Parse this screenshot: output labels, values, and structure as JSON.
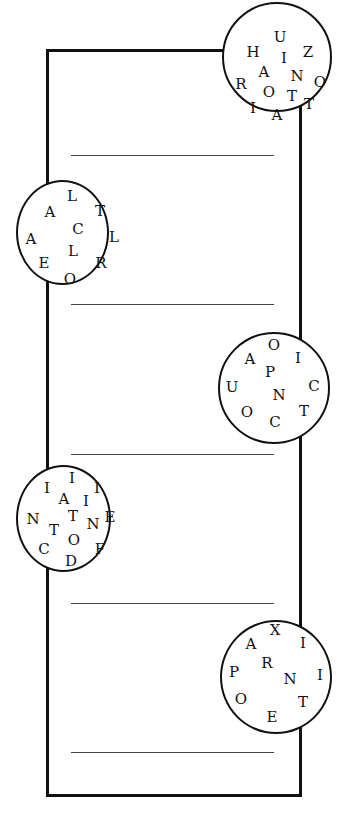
{
  "puzzle": {
    "circles": [
      {
        "letters": [
          "U",
          "H",
          "I",
          "Z",
          "A",
          "N",
          "O",
          "R",
          "O",
          "T",
          "I",
          "A",
          "T"
        ]
      },
      {
        "letters": [
          "L",
          "A",
          "T",
          "C",
          "A",
          "L",
          "L",
          "E",
          "R",
          "O"
        ]
      },
      {
        "letters": [
          "O",
          "A",
          "I",
          "P",
          "U",
          "C",
          "N",
          "O",
          "T",
          "C"
        ]
      },
      {
        "letters": [
          "I",
          "I",
          "A",
          "I",
          "I",
          "N",
          "T",
          "N",
          "E",
          "T",
          "O",
          "C",
          "F",
          "D"
        ]
      },
      {
        "letters": [
          "X",
          "A",
          "I",
          "R",
          "P",
          "N",
          "I",
          "O",
          "T",
          "E"
        ]
      }
    ],
    "answer_lines": 5
  }
}
